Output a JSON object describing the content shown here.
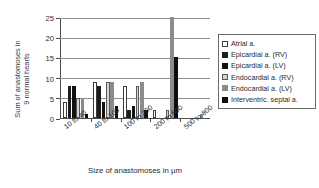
{
  "chart_data": {
    "type": "bar",
    "title": "",
    "xlabel": "Size of anastomoses in µm",
    "ylabel": "Sum of anastomoses in 9 normal hearts",
    "ylabel_line1": "Sum of anastomoses in",
    "ylabel_line2": "9 normal hearts",
    "categories": [
      "10 to 40",
      "40 to 100",
      "100 to 200",
      "200 to 500",
      "500 to 800"
    ],
    "ylim": [
      0,
      25
    ],
    "yticks": [
      0,
      5,
      10,
      15,
      20,
      25
    ],
    "grid": true,
    "legend_position": "right",
    "series": [
      {
        "name": "Atrial a.",
        "color": "#ffffff",
        "values": [
          4,
          9,
          8,
          2,
          0
        ]
      },
      {
        "name": "Epicardial a. (RV)",
        "color": "#1c1c1c",
        "values": [
          8,
          8,
          2,
          0,
          0
        ]
      },
      {
        "name": "Epicardial a. (LV)",
        "color": "#111111",
        "values": [
          8,
          4,
          3,
          0,
          0
        ]
      },
      {
        "name": "Endocardial a. (RV)",
        "color": "#d2d2d2",
        "values": [
          5,
          9,
          8,
          2,
          0
        ]
      },
      {
        "name": "Endocardial a. (LV)",
        "color": "#8c8c8c",
        "values": [
          5,
          9,
          9,
          26,
          1
        ]
      },
      {
        "name": "Interventric. septal a.",
        "color": "#0d0d0d",
        "values": [
          1,
          3,
          2,
          15,
          0
        ]
      }
    ]
  },
  "legend": {
    "items": [
      {
        "label": "Atrial a."
      },
      {
        "label": "Epicardial a. (RV)"
      },
      {
        "label": "Epicardial a. (LV)"
      },
      {
        "label": "Endocardial a. (RV)"
      },
      {
        "label": "Endocardial a. (LV)"
      },
      {
        "label": "Interventric. septal a."
      }
    ]
  }
}
